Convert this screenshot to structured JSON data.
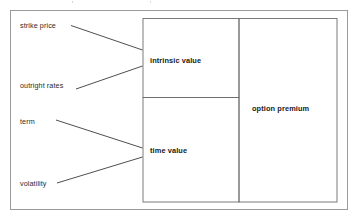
{
  "diagram": {
    "type": "flow-diagram",
    "inputs": [
      {
        "id": "strike-price",
        "label": "strike price",
        "target": "intrinsic value"
      },
      {
        "id": "outright-rates",
        "label": "outright rates",
        "target": "intrinsic value"
      },
      {
        "id": "term",
        "label": "term",
        "target": "time value"
      },
      {
        "id": "volatility",
        "label": "volatility",
        "target": "time value"
      }
    ],
    "components": [
      {
        "id": "intrinsic-value",
        "label": "intrinsic value"
      },
      {
        "id": "time-value",
        "label": "time value"
      }
    ],
    "result": {
      "id": "option-premium",
      "label": "option premium"
    },
    "colors": {
      "frame_border": "#9a9a9a",
      "box_border": "#6e6e6e",
      "connector": "#3a3a3a",
      "label_text": "#2b2b2b",
      "caption_text": "#1a1a1a",
      "background": "#ffffff"
    }
  }
}
